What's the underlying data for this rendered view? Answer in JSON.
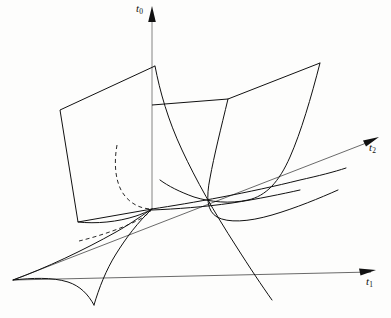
{
  "figure": {
    "type": "swallowtail-catastrophe-surface",
    "background_color": "#fdfdfc",
    "stroke_color": "#111111",
    "axis_color": "#333333",
    "width": 391,
    "height": 318
  },
  "axes": {
    "origin": {
      "x": 152,
      "y": 208
    },
    "items": [
      {
        "name": "t0",
        "label_main": "t",
        "label_sub": "0",
        "direction": "vertical-up",
        "arrow_tip": {
          "x": 152,
          "y": 7
        },
        "tail": {
          "x": 152,
          "y": 208
        }
      },
      {
        "name": "t2",
        "label_main": "t",
        "label_sub": "2",
        "direction": "upper-right",
        "arrow_tip": {
          "x": 379,
          "y": 137
        },
        "tail": {
          "x": 13,
          "y": 280
        }
      },
      {
        "name": "t1",
        "label_main": "t",
        "label_sub": "1",
        "direction": "lower-right",
        "arrow_tip": {
          "x": 376,
          "y": 270
        },
        "tail": {
          "x": 13,
          "y": 280
        }
      }
    ]
  },
  "geometry": {
    "left_panel": {
      "name": "left-flat-sheet",
      "corners": [
        {
          "x": 60,
          "y": 110
        },
        {
          "x": 155,
          "y": 66
        },
        {
          "x": 152,
          "y": 208
        },
        {
          "x": 78,
          "y": 222
        }
      ]
    },
    "upper_ridge": {
      "name": "upper-fold-ridge",
      "points": [
        {
          "x": 152,
          "y": 105
        },
        {
          "x": 228,
          "y": 99
        },
        {
          "x": 320,
          "y": 63
        }
      ]
    },
    "curves": [
      {
        "name": "front-descending-curve",
        "description": "steep curve from top of left sheet down through origin region"
      },
      {
        "name": "middle-parabola",
        "description": "parabolic fold curve from mid-ridge sweeping to lower right"
      },
      {
        "name": "right-parabola",
        "description": "large parabola from upper-right corner down to valley floor"
      },
      {
        "name": "valley-floor",
        "description": "long shallow curve from origin out to the right"
      },
      {
        "name": "cusp-left-branch",
        "description": "lower-left curved branch meeting the cusp point"
      },
      {
        "name": "cusp-right-branch",
        "description": "lower-right curved branch meeting the cusp point"
      }
    ],
    "cusp_point": {
      "x": 94,
      "y": 305
    },
    "left_vertex": {
      "x": 13,
      "y": 280
    },
    "dashed_segments": [
      {
        "name": "hidden-base-edge",
        "from": {
          "x": 78,
          "y": 240
        },
        "to": {
          "x": 150,
          "y": 212
        }
      },
      {
        "name": "hidden-interior-curve",
        "from": {
          "x": 117,
          "y": 145
        },
        "to": {
          "x": 150,
          "y": 208
        }
      }
    ]
  }
}
